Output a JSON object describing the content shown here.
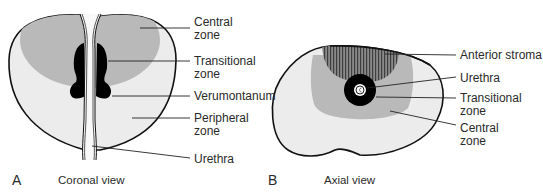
{
  "figure": {
    "panels": [
      {
        "letter": "A",
        "caption": "Coronal view",
        "labels": [
          {
            "text": "Central\nzone"
          },
          {
            "text": "Transitional\nzone"
          },
          {
            "text": "Verumontanum"
          },
          {
            "text": "Peripheral\nzone"
          },
          {
            "text": "Urethra"
          }
        ]
      },
      {
        "letter": "B",
        "caption": "Axial view",
        "labels": [
          {
            "text": "Anterior stroma"
          },
          {
            "text": "Urethra"
          },
          {
            "text": "Transitional\nzone"
          },
          {
            "text": "Central\nzone"
          }
        ]
      }
    ]
  },
  "colors": {
    "outline": "#111111",
    "peripheral_fill": "#ececec",
    "central_fill": "#b9b9b9",
    "transitional_fill": "#000000",
    "stroma_fill": "#6e6e6e",
    "text": "#2a2a2a"
  }
}
